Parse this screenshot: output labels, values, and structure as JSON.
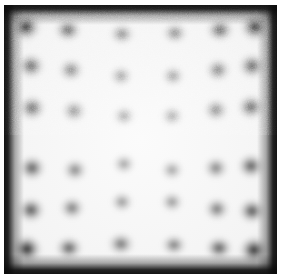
{
  "image": {
    "kind": "grayscale-micrograph",
    "width": 281,
    "height": 278,
    "title": "Noisy square field with dark border and distorted dot lattice",
    "alt_text": "Grayscale noisy micrograph: bright square plate bounded by a dark frame, containing a 6 by 6 lattice of blurred dark spots whose rows and columns bow outward (barrel distortion); corner spots are the darkest and the center of the field is nearly blank."
  },
  "palette": {
    "paper": "#ffffff",
    "plate_bright": "#fbfbfb",
    "plate_mid": "#e2e2e2",
    "frame_dark": "#0a0a0a",
    "spot_dark": "#1a1a1a",
    "spot_mid": "#4a4a4a",
    "spot_faint": "#8a8a8a"
  },
  "field": {
    "margin_px": 4,
    "frame_thickness_px": 6,
    "noise": "fine grain, uniform",
    "vignette": "dark edges, bright center"
  },
  "chart_data": {
    "type": "scatter",
    "xlabel": "x (px)",
    "ylabel": "y (px)",
    "xlim": [
      0,
      281
    ],
    "ylim": [
      0,
      278
    ],
    "grid": false,
    "legend": null,
    "rows": 6,
    "cols": 6,
    "points": [
      {
        "x": 26,
        "y": 27,
        "rx": 15,
        "ry": 14,
        "darkness": 1.0
      },
      {
        "x": 68,
        "y": 30,
        "rx": 14,
        "ry": 12,
        "darkness": 0.74
      },
      {
        "x": 122,
        "y": 34,
        "rx": 13,
        "ry": 11,
        "darkness": 0.52
      },
      {
        "x": 175,
        "y": 33,
        "rx": 13,
        "ry": 11,
        "darkness": 0.54
      },
      {
        "x": 220,
        "y": 30,
        "rx": 14,
        "ry": 12,
        "darkness": 0.76
      },
      {
        "x": 255,
        "y": 27,
        "rx": 15,
        "ry": 14,
        "darkness": 0.98
      },
      {
        "x": 31,
        "y": 66,
        "rx": 14,
        "ry": 13,
        "darkness": 0.74
      },
      {
        "x": 71,
        "y": 70,
        "rx": 13,
        "ry": 12,
        "darkness": 0.56
      },
      {
        "x": 121,
        "y": 76,
        "rx": 12,
        "ry": 11,
        "darkness": 0.4
      },
      {
        "x": 173,
        "y": 76,
        "rx": 12,
        "ry": 11,
        "darkness": 0.41
      },
      {
        "x": 218,
        "y": 70,
        "rx": 13,
        "ry": 12,
        "darkness": 0.58
      },
      {
        "x": 252,
        "y": 66,
        "rx": 14,
        "ry": 13,
        "darkness": 0.76
      },
      {
        "x": 32,
        "y": 108,
        "rx": 14,
        "ry": 13,
        "darkness": 0.72
      },
      {
        "x": 74,
        "y": 111,
        "rx": 13,
        "ry": 12,
        "darkness": 0.48
      },
      {
        "x": 124,
        "y": 116,
        "rx": 12,
        "ry": 11,
        "darkness": 0.34
      },
      {
        "x": 172,
        "y": 116,
        "rx": 12,
        "ry": 11,
        "darkness": 0.34
      },
      {
        "x": 216,
        "y": 110,
        "rx": 13,
        "ry": 12,
        "darkness": 0.52
      },
      {
        "x": 251,
        "y": 107,
        "rx": 14,
        "ry": 13,
        "darkness": 0.74
      },
      {
        "x": 32,
        "y": 168,
        "rx": 14,
        "ry": 13,
        "darkness": 0.72
      },
      {
        "x": 75,
        "y": 170,
        "rx": 13,
        "ry": 12,
        "darkness": 0.5
      },
      {
        "x": 124,
        "y": 164,
        "rx": 12,
        "ry": 11,
        "darkness": 0.36
      },
      {
        "x": 172,
        "y": 170,
        "rx": 12,
        "ry": 11,
        "darkness": 0.36
      },
      {
        "x": 216,
        "y": 168,
        "rx": 13,
        "ry": 12,
        "darkness": 0.52
      },
      {
        "x": 251,
        "y": 166,
        "rx": 14,
        "ry": 13,
        "darkness": 0.74
      },
      {
        "x": 31,
        "y": 210,
        "rx": 14,
        "ry": 13,
        "darkness": 0.76
      },
      {
        "x": 72,
        "y": 208,
        "rx": 13,
        "ry": 12,
        "darkness": 0.56
      },
      {
        "x": 122,
        "y": 202,
        "rx": 12,
        "ry": 11,
        "darkness": 0.42
      },
      {
        "x": 172,
        "y": 202,
        "rx": 12,
        "ry": 11,
        "darkness": 0.42
      },
      {
        "x": 217,
        "y": 209,
        "rx": 13,
        "ry": 12,
        "darkness": 0.58
      },
      {
        "x": 252,
        "y": 211,
        "rx": 14,
        "ry": 13,
        "darkness": 0.78
      },
      {
        "x": 27,
        "y": 249,
        "rx": 15,
        "ry": 14,
        "darkness": 1.0
      },
      {
        "x": 69,
        "y": 248,
        "rx": 14,
        "ry": 12,
        "darkness": 0.72
      },
      {
        "x": 121,
        "y": 244,
        "rx": 14,
        "ry": 12,
        "darkness": 0.6
      },
      {
        "x": 174,
        "y": 245,
        "rx": 13,
        "ry": 11,
        "darkness": 0.56
      },
      {
        "x": 219,
        "y": 248,
        "rx": 14,
        "ry": 12,
        "darkness": 0.74
      },
      {
        "x": 254,
        "y": 250,
        "rx": 15,
        "ry": 14,
        "darkness": 0.98
      }
    ]
  }
}
